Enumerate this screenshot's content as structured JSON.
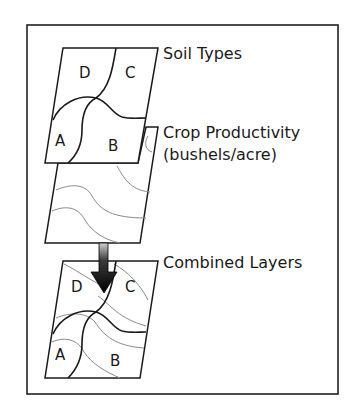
{
  "diagram": {
    "layers": [
      {
        "id": "soil",
        "label": "Soil Types"
      },
      {
        "id": "crop",
        "label": "Crop Productivity",
        "sublabel": "(bushels/acre)"
      },
      {
        "id": "combined",
        "label": "Combined Layers"
      }
    ],
    "regions": {
      "top": [
        "D",
        "C",
        "A",
        "B"
      ],
      "bottom": [
        "D",
        "C",
        "A",
        "B"
      ]
    },
    "colors": {
      "stroke": "#1a1a1a",
      "contour": "#8a8a8a",
      "frame": "#222222"
    }
  }
}
